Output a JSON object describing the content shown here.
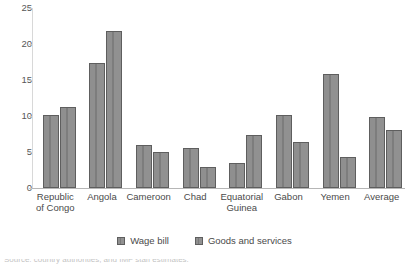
{
  "chart_data": {
    "type": "bar",
    "title": "",
    "subtitle": "",
    "xlabel": "",
    "ylabel": "",
    "ylim": [
      0,
      25
    ],
    "yticks": [
      0,
      5,
      10,
      15,
      20,
      25
    ],
    "grid": false,
    "legend_position": "bottom",
    "categories": [
      "Republic\nof Congo",
      "Angola",
      "Cameroon",
      "Chad",
      "Equatorial\nGuinea",
      "Gabon",
      "Yemen",
      "Average"
    ],
    "series": [
      {
        "name": "Wage bill",
        "values": [
          10.1,
          17.3,
          6.0,
          5.5,
          3.5,
          10.1,
          15.8,
          9.8
        ]
      },
      {
        "name": "Goods and services",
        "values": [
          11.3,
          21.8,
          5.0,
          2.9,
          7.4,
          6.4,
          4.3,
          8.0
        ]
      }
    ],
    "colors": {
      "bar_fill": "#8d8d8d",
      "bar_border": "#5e5e5e",
      "axis": "#b6b6b6",
      "text": "#4a4a4a"
    }
  },
  "legend": {
    "items": [
      {
        "label": "Wage bill"
      },
      {
        "label": "Goods and services"
      }
    ]
  },
  "caption": {
    "text": "Source: country authorities; and IMF staff estimates."
  }
}
